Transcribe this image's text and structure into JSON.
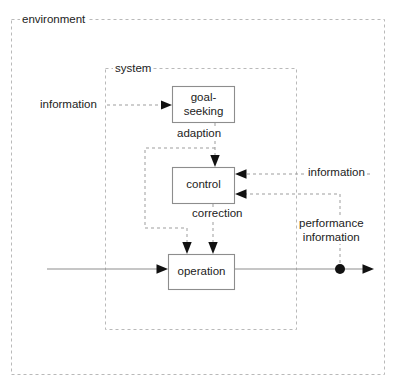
{
  "diagram": {
    "regions": [
      {
        "id": "environment",
        "label": "environment",
        "x": 11,
        "y": 19,
        "w": 374,
        "h": 356
      },
      {
        "id": "system",
        "label": "system",
        "x": 105,
        "y": 68,
        "w": 192,
        "h": 262
      }
    ],
    "nodes": [
      {
        "id": "goal-seeking",
        "label": "goal-\nseeking",
        "line1": "goal-",
        "line2": "seeking",
        "x": 172,
        "y": 86,
        "w": 63,
        "h": 37
      },
      {
        "id": "control",
        "label": "control",
        "x": 172,
        "y": 167,
        "w": 63,
        "h": 37
      },
      {
        "id": "operation",
        "label": "operation",
        "x": 168,
        "y": 254,
        "w": 67,
        "h": 36
      }
    ],
    "edge_labels": [
      {
        "id": "information-input",
        "text": "information",
        "x": 38,
        "y": 98
      },
      {
        "id": "adaption",
        "text": "adaption",
        "x": 175,
        "y": 127
      },
      {
        "id": "correction",
        "text": "correction",
        "x": 190,
        "y": 207
      },
      {
        "id": "information-right",
        "text": "information",
        "x": 306,
        "y": 166
      },
      {
        "id": "performance-information-line1",
        "text": "performance",
        "x": 301,
        "y": 219
      },
      {
        "id": "performance-information-line2",
        "text": "information",
        "x": 304,
        "y": 232
      }
    ],
    "colors": {
      "region_stroke": "#b9b9b9",
      "box_stroke": "#8d8d8d",
      "connector_dashed": "#9d9d9d",
      "connector_solid": "#8d8d8d",
      "arrow_fill": "#111111",
      "text": "#222222",
      "background": "#ffffff"
    }
  }
}
